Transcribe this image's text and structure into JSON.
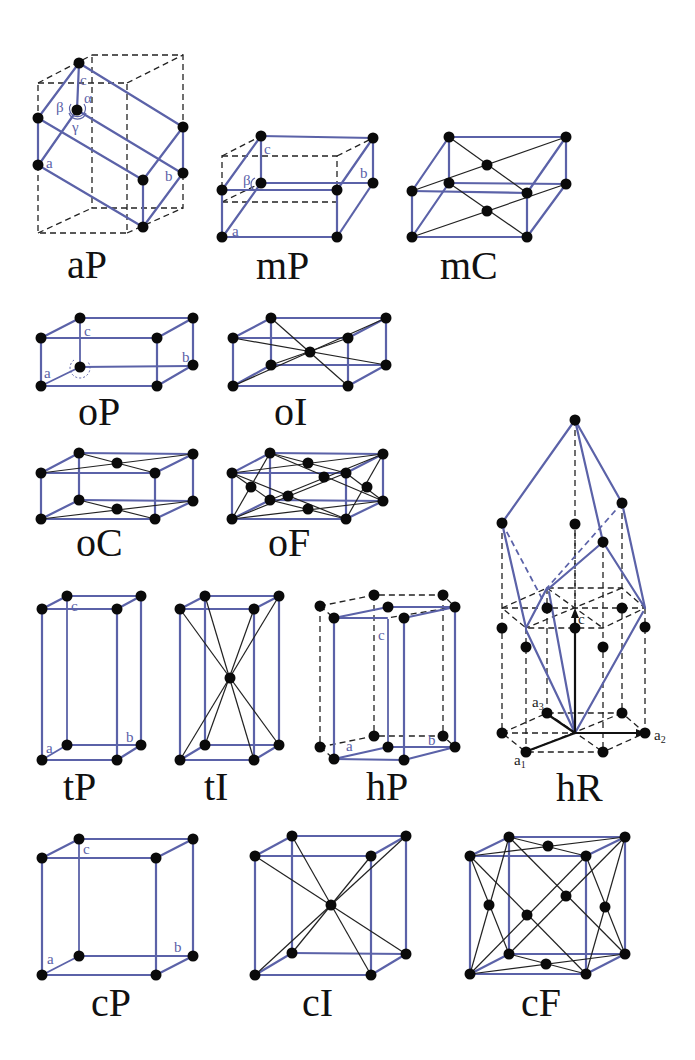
{
  "figure": {
    "colors": {
      "edge": "#5b62a8",
      "atom": "#0a0a0a",
      "dashed": "#222222",
      "background": "#ffffff"
    },
    "lattices": [
      {
        "id": "aP",
        "label": "aP",
        "system": "triclinic",
        "centering": "primitive",
        "axis_labels": [
          "a",
          "b",
          "c"
        ],
        "angle_labels": [
          "α",
          "β",
          "γ"
        ]
      },
      {
        "id": "mP",
        "label": "mP",
        "system": "monoclinic",
        "centering": "primitive",
        "axis_labels": [
          "a",
          "b",
          "c"
        ],
        "angle_labels": [
          "β"
        ]
      },
      {
        "id": "mC",
        "label": "mC",
        "system": "monoclinic",
        "centering": "base-centered"
      },
      {
        "id": "oP",
        "label": "oP",
        "system": "orthorhombic",
        "centering": "primitive",
        "axis_labels": [
          "a",
          "b",
          "c"
        ]
      },
      {
        "id": "oI",
        "label": "oI",
        "system": "orthorhombic",
        "centering": "body-centered"
      },
      {
        "id": "oC",
        "label": "oC",
        "system": "orthorhombic",
        "centering": "base-centered"
      },
      {
        "id": "oF",
        "label": "oF",
        "system": "orthorhombic",
        "centering": "face-centered"
      },
      {
        "id": "tP",
        "label": "tP",
        "system": "tetragonal",
        "centering": "primitive",
        "axis_labels": [
          "a",
          "b",
          "c"
        ]
      },
      {
        "id": "tI",
        "label": "tI",
        "system": "tetragonal",
        "centering": "body-centered"
      },
      {
        "id": "hP",
        "label": "hP",
        "system": "hexagonal",
        "centering": "primitive",
        "axis_labels": [
          "a",
          "b",
          "c"
        ]
      },
      {
        "id": "hR",
        "label": "hR",
        "system": "rhombohedral",
        "centering": "rhombohedral",
        "axis_labels": [
          "a1",
          "a2",
          "a3",
          "c"
        ]
      },
      {
        "id": "cP",
        "label": "cP",
        "system": "cubic",
        "centering": "primitive",
        "axis_labels": [
          "a",
          "b",
          "c"
        ]
      },
      {
        "id": "cI",
        "label": "cI",
        "system": "cubic",
        "centering": "body-centered"
      },
      {
        "id": "cF",
        "label": "cF",
        "system": "cubic",
        "centering": "face-centered"
      }
    ],
    "axis_text": {
      "a": "a",
      "b": "b",
      "c": "c",
      "alpha": "α",
      "beta": "β",
      "gamma": "γ",
      "a_base": "a",
      "sub1": "1",
      "sub2": "2",
      "sub3": "3"
    }
  }
}
